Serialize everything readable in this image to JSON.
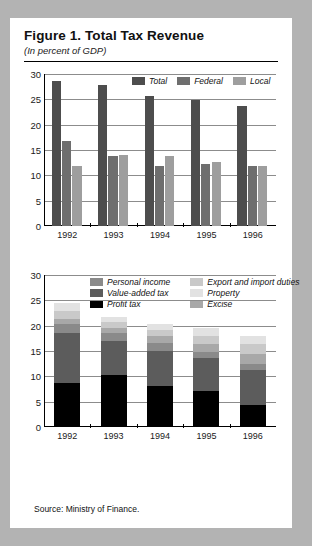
{
  "figure": {
    "title": "Figure 1.  Total Tax Revenue",
    "subtitle": "(In percent of GDP)",
    "source": "Source:  Ministry of Finance."
  },
  "colors": {
    "page_background": "#b3b3b3",
    "panel": "#ffffff",
    "total": "#4d4d4d",
    "federal": "#6e6e6e",
    "local": "#9e9e9e",
    "personal_income": "#8a8a8a",
    "value_added_tax": "#5c5c5c",
    "profit_tax": "#000000",
    "export_import_duties": "#c9c9c9",
    "property": "#e2e2e2",
    "excise": "#a8a8a8",
    "gridline": "#8c8c8c",
    "axis": "#000000"
  },
  "chart_data": [
    {
      "type": "bar",
      "id": "total-tax-revenue-by-level",
      "title": "",
      "xlabel": "",
      "ylabel": "",
      "ylim": [
        0,
        30
      ],
      "yticks": [
        0,
        5,
        10,
        15,
        20,
        25,
        30
      ],
      "grid": true,
      "legend_position": "top-right",
      "categories": [
        "1992",
        "1993",
        "1994",
        "1995",
        "1996"
      ],
      "series": [
        {
          "name": "Total",
          "values": [
            28.6,
            27.8,
            25.7,
            24.9,
            23.7
          ]
        },
        {
          "name": "Federal",
          "values": [
            16.7,
            13.8,
            11.9,
            12.2,
            11.9
          ]
        },
        {
          "name": "Local",
          "values": [
            11.8,
            14.0,
            13.9,
            12.6,
            11.9
          ]
        }
      ]
    },
    {
      "type": "bar",
      "id": "tax-revenue-by-component",
      "stacked": true,
      "title": "",
      "xlabel": "",
      "ylabel": "",
      "ylim": [
        0,
        30
      ],
      "yticks": [
        0,
        5,
        10,
        15,
        20,
        25,
        30
      ],
      "grid": true,
      "legend_position": "top-center",
      "categories": [
        "1992",
        "1993",
        "1994",
        "1995",
        "1996"
      ],
      "series": [
        {
          "name": "Profit tax",
          "values": [
            8.7,
            10.3,
            8.1,
            7.1,
            4.4
          ]
        },
        {
          "name": "Value-added tax",
          "values": [
            9.9,
            6.7,
            6.9,
            6.5,
            6.8
          ]
        },
        {
          "name": "Personal income",
          "values": [
            1.7,
            1.6,
            1.6,
            1.3,
            1.3
          ]
        },
        {
          "name": "Excise",
          "values": [
            1.0,
            1.0,
            1.3,
            1.5,
            1.9
          ]
        },
        {
          "name": "Export and import duties",
          "values": [
            1.6,
            1.2,
            1.3,
            1.6,
            2.0
          ]
        },
        {
          "name": "Property",
          "values": [
            1.5,
            0.9,
            1.2,
            1.5,
            1.6
          ]
        }
      ],
      "totals": [
        24.4,
        21.7,
        20.4,
        19.5,
        18.0
      ]
    }
  ],
  "chart1_legend": [
    {
      "label": "Total",
      "color_key": "total"
    },
    {
      "label": "Federal",
      "color_key": "federal"
    },
    {
      "label": "Local",
      "color_key": "local"
    }
  ],
  "chart2_legend": [
    {
      "label": "Personal income",
      "color_key": "personal_income"
    },
    {
      "label": "Export and import duties",
      "color_key": "export_import_duties"
    },
    {
      "label": "Value-added tax",
      "color_key": "value_added_tax"
    },
    {
      "label": "Property",
      "color_key": "property"
    },
    {
      "label": "Profit tax",
      "color_key": "profit_tax"
    },
    {
      "label": "Excise",
      "color_key": "excise"
    }
  ]
}
